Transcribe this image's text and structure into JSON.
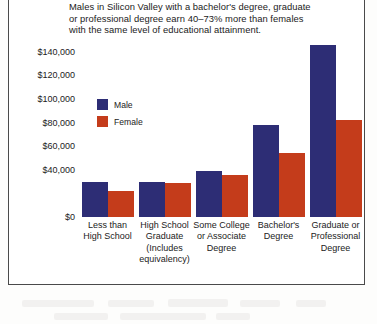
{
  "chart_data": {
    "type": "bar",
    "title": "Males in Silicon Valley with a bachelor's degree,  graduate or professional degree earn 40–73% more than females with the same level of educational attainment.",
    "xlabel": "",
    "ylabel": "",
    "ylim": [
      0,
      150000
    ],
    "grid": false,
    "legend_position": "inside-upper-left",
    "ytick_labels": [
      "$0",
      "$40,000",
      "$60,000",
      "$80,000",
      "$100,000",
      "$120,000",
      "$140,000"
    ],
    "ytick_values": [
      0,
      40000,
      60000,
      80000,
      100000,
      120000,
      140000
    ],
    "categories": [
      "Less than High School",
      "High School Graduate (Includes equivalency)",
      "Some College or Associate Degree",
      "Bachelor's Degree",
      "Graduate or Professional Degree"
    ],
    "category_lines": [
      [
        "Less than",
        "High School"
      ],
      [
        "High School",
        "Graduate",
        "(Includes",
        "equivalency)"
      ],
      [
        "Some College",
        "or Associate",
        "Degree"
      ],
      [
        "Bachelor's",
        "Degree"
      ],
      [
        "Graduate or",
        "Professional",
        "Degree"
      ]
    ],
    "series": [
      {
        "name": "Male",
        "color": "#2d2d75",
        "values": [
          30000,
          30000,
          39000,
          78000,
          146000
        ]
      },
      {
        "name": "Female",
        "color": "#c43c1b",
        "values": [
          22000,
          29000,
          36000,
          54000,
          82000
        ]
      }
    ]
  },
  "legend": {
    "items": [
      {
        "label": "Male",
        "color": "#2d2d75"
      },
      {
        "label": "Female",
        "color": "#c43c1b"
      }
    ]
  }
}
